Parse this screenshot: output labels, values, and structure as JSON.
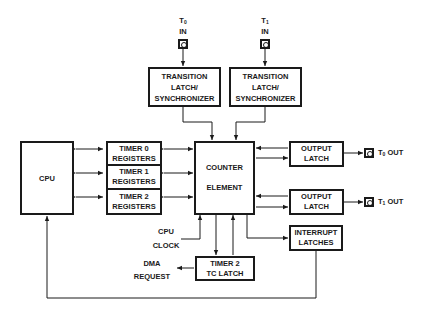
{
  "diagram": {
    "title": "",
    "nodes": {
      "t0_in": {
        "prefix": "T",
        "sub": "0",
        "suffix": "IN"
      },
      "t1_in": {
        "prefix": "T",
        "sub": "1",
        "suffix": "IN"
      },
      "sync0": {
        "line1": "TRANSITION",
        "line2": "LATCH/",
        "line3": "SYNCHRONIZER"
      },
      "sync1": {
        "line1": "TRANSITION",
        "line2": "LATCH/",
        "line3": "SYNCHRONIZER"
      },
      "cpu": {
        "label": "CPU"
      },
      "timer0": {
        "line1": "TIMER 0",
        "line2": "REGISTERS"
      },
      "timer1": {
        "line1": "TIMER 1",
        "line2": "REGISTERS"
      },
      "timer2": {
        "line1": "TIMER 2",
        "line2": "REGISTERS"
      },
      "counter": {
        "line1": "COUNTER",
        "line2": "ELEMENT"
      },
      "out_latch0": {
        "line1": "OUTPUT",
        "line2": "LATCH"
      },
      "out_latch1": {
        "line1": "OUTPUT",
        "line2": "LATCH"
      },
      "t0_out": {
        "prefix": "T",
        "sub": "0",
        "suffix": " OUT"
      },
      "t1_out": {
        "prefix": "T",
        "sub": "1",
        "suffix": " OUT"
      },
      "interrupt": {
        "line1": "INTERRUPT",
        "line2": "LATCHES"
      },
      "cpu_clock": {
        "line1": "CPU",
        "line2": "CLOCK"
      },
      "tc_latch": {
        "line1": "TIMER 2",
        "line2": "TC LATCH"
      },
      "dma": {
        "line1": "DMA",
        "line2": "REQUEST"
      }
    },
    "edges": [
      {
        "from": "T0 IN",
        "to": "TRANSITION LATCH/SYNCHRONIZER (0)"
      },
      {
        "from": "T1 IN",
        "to": "TRANSITION LATCH/SYNCHRONIZER (1)"
      },
      {
        "from": "TRANSITION LATCH/SYNCHRONIZER (0)",
        "to": "COUNTER ELEMENT"
      },
      {
        "from": "TRANSITION LATCH/SYNCHRONIZER (1)",
        "to": "COUNTER ELEMENT"
      },
      {
        "from": "CPU",
        "to": "TIMER 0 REGISTERS",
        "bidirectional": true
      },
      {
        "from": "CPU",
        "to": "TIMER 1 REGISTERS",
        "bidirectional": true
      },
      {
        "from": "CPU",
        "to": "TIMER 2 REGISTERS",
        "bidirectional": true
      },
      {
        "from": "TIMER 0 REGISTERS",
        "to": "COUNTER ELEMENT",
        "bidirectional": true
      },
      {
        "from": "TIMER 1 REGISTERS",
        "to": "COUNTER ELEMENT",
        "bidirectional": true
      },
      {
        "from": "TIMER 2 REGISTERS",
        "to": "COUNTER ELEMENT",
        "bidirectional": true
      },
      {
        "from": "COUNTER ELEMENT",
        "to": "OUTPUT LATCH (0)",
        "bidirectional": true
      },
      {
        "from": "COUNTER ELEMENT",
        "to": "OUTPUT LATCH (1)",
        "bidirectional": true
      },
      {
        "from": "OUTPUT LATCH (0)",
        "to": "T0 OUT"
      },
      {
        "from": "OUTPUT LATCH (1)",
        "to": "T1 OUT"
      },
      {
        "from": "COUNTER ELEMENT",
        "to": "INTERRUPT LATCHES"
      },
      {
        "from": "CPU CLOCK",
        "to": "COUNTER ELEMENT"
      },
      {
        "from": "COUNTER ELEMENT",
        "to": "TIMER 2 TC LATCH"
      },
      {
        "from": "TIMER 2 TC LATCH",
        "to": "COUNTER ELEMENT"
      },
      {
        "from": "TIMER 2 TC LATCH",
        "to": "DMA REQUEST"
      },
      {
        "from": "INTERRUPT LATCHES",
        "to": "CPU"
      }
    ]
  }
}
